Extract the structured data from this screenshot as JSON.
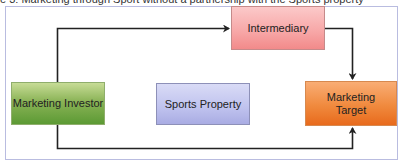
{
  "caption": "e 3: Marketing through Sport without a partnership with the Sports property",
  "nodes": {
    "investor": "Marketing Investor",
    "sports_property": "Sports Property",
    "intermediary": "Intermediary",
    "target_line1": "Marketing",
    "target_line2": "Target"
  },
  "edges": [
    {
      "from": "Marketing Investor",
      "to": "Intermediary"
    },
    {
      "from": "Intermediary",
      "to": "Marketing Target"
    },
    {
      "from": "Marketing Investor",
      "to": "Marketing Target"
    }
  ],
  "colors": {
    "investor": "#6fa53f",
    "sports_property": "#bfc2ee",
    "intermediary": "#f7a6a6",
    "target": "#f08a3e",
    "connector": "#222222",
    "frame": "#b9bce0"
  }
}
